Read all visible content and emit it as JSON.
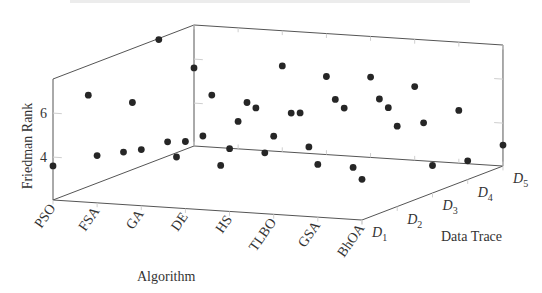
{
  "chart_data": {
    "type": "scatter",
    "projection": "3d",
    "title": "",
    "xlabel": "Algorithm",
    "ylabel": "Data Trace",
    "zlabel": "Friedman Rank",
    "x_categories": [
      "PSO",
      "FSA",
      "GA",
      "DE",
      "HS",
      "TLBO",
      "GSA",
      "BhOA"
    ],
    "y_categories": [
      "D1",
      "D2",
      "D3",
      "D4",
      "D5"
    ],
    "z_ticks": [
      4,
      6
    ],
    "zlim": [
      2,
      7.5
    ],
    "grid": false,
    "legend": null,
    "series": [
      {
        "name": "PSO",
        "values": [
          3.6,
          6.2,
          3.0,
          7.5,
          5.6
        ]
      },
      {
        "name": "FSA",
        "values": [
          4.2,
          6.0,
          3.6,
          3.25,
          3.3
        ]
      },
      {
        "name": "GA",
        "values": [
          4.6,
          3.65,
          5.85,
          4.9,
          5.95
        ]
      },
      {
        "name": "DE",
        "values": [
          5.1,
          3.4,
          5.4,
          4.55,
          5.6
        ]
      },
      {
        "name": "HS",
        "values": [
          4.9,
          4.1,
          5.3,
          5.3,
          5.7
        ]
      },
      {
        "name": "TLBO",
        "values": [
          5.6,
          4.5,
          5.65,
          5.45,
          5.4
        ]
      },
      {
        "name": "GSA",
        "values": [
          4.45,
          3.7,
          5.8,
          4.5,
          4.45
        ]
      },
      {
        "name": "BhOA",
        "values": [
          3.9,
          5.7,
          3.3,
          2.9,
          3.0
        ]
      }
    ]
  },
  "axes": {
    "x_label": "Algorithm",
    "y_label": "Data Trace",
    "z_label": "Friedman Rank",
    "z_tick_labels": [
      "4",
      "6"
    ],
    "y_tick_labels": [
      {
        "main": "D",
        "sub": "1"
      },
      {
        "main": "D",
        "sub": "2"
      },
      {
        "main": "D",
        "sub": "3"
      },
      {
        "main": "D",
        "sub": "4"
      },
      {
        "main": "D",
        "sub": "5"
      }
    ]
  },
  "style": {
    "dot_color": "#262626",
    "frame_color": "#555555",
    "text_color": "#333333"
  }
}
